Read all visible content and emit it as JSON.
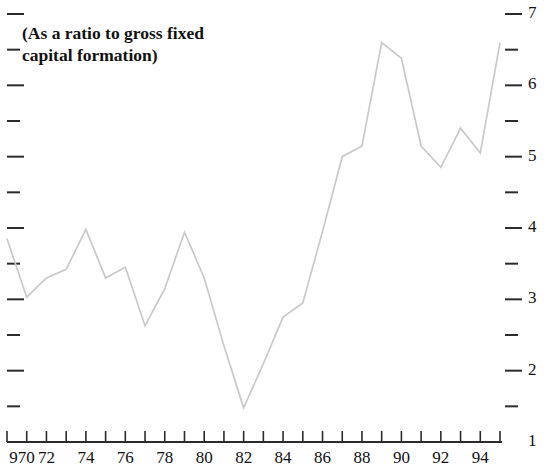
{
  "chart_data": {
    "type": "line",
    "title": "(As a ratio to gross fixed\ncapital formation)",
    "xlabel": "",
    "ylabel": "",
    "grid": false,
    "legend": null,
    "xlim": [
      1970,
      1995
    ],
    "ylim": [
      1,
      7
    ],
    "y_ticks_major": [
      7,
      6,
      5,
      4,
      3,
      2,
      1
    ],
    "y_tick_labels": [
      "7",
      "6",
      "5",
      "4",
      "3",
      "2",
      "1"
    ],
    "y_ticks_minor": [
      6.5,
      5.5,
      4.5,
      3.5,
      2.5,
      1.5
    ],
    "y_axis_position": "right",
    "x_ticks": [
      1970,
      1971,
      1972,
      1973,
      1974,
      1975,
      1976,
      1977,
      1978,
      1979,
      1980,
      1981,
      1982,
      1983,
      1984,
      1985,
      1986,
      1987,
      1988,
      1989,
      1990,
      1991,
      1992,
      1993,
      1994,
      1995
    ],
    "x_tick_labels": [
      "970",
      "",
      "72",
      "",
      "74",
      "",
      "76",
      "",
      "78",
      "",
      "80",
      "",
      "82",
      "",
      "84",
      "",
      "86",
      "",
      "88",
      "",
      "90",
      "",
      "92",
      "",
      "94",
      ""
    ],
    "line_color": "#c9c9c9",
    "axis_color": "#2b2b2b",
    "series": [
      {
        "name": "ratio",
        "x": [
          1970,
          1971,
          1972,
          1973,
          1974,
          1975,
          1976,
          1977,
          1978,
          1979,
          1980,
          1981,
          1982,
          1983,
          1984,
          1985,
          1986,
          1987,
          1988,
          1989,
          1990,
          1991,
          1992,
          1993,
          1994,
          1995
        ],
        "values": [
          3.85,
          3.03,
          3.3,
          3.42,
          3.98,
          3.3,
          3.45,
          2.63,
          3.15,
          3.94,
          3.3,
          2.35,
          1.48,
          2.1,
          2.75,
          2.95,
          3.95,
          5.0,
          5.15,
          6.6,
          6.38,
          5.15,
          4.85,
          5.4,
          5.05,
          6.6
        ]
      }
    ]
  }
}
